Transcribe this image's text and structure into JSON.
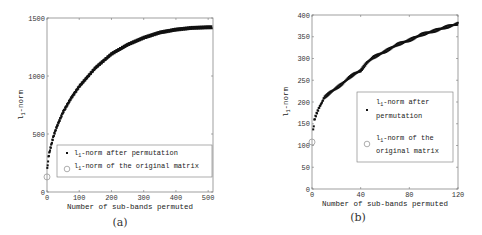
{
  "chart_data": [
    {
      "type": "scatter",
      "panel": "(a)",
      "xlabel": "Number of sub-bands permuted",
      "ylabel": "l1-norm",
      "xlim": [
        0,
        515
      ],
      "ylim": [
        0,
        1500
      ],
      "xticks": [
        0,
        100,
        200,
        300,
        400,
        500
      ],
      "yticks": [
        0,
        500,
        1000,
        1500
      ],
      "grid": false,
      "legend_position": "lower right (inside)",
      "series": [
        {
          "name": "l1-norm after permutation",
          "marker": "dot",
          "x": [
            1,
            5,
            10,
            20,
            30,
            50,
            75,
            100,
            150,
            200,
            250,
            300,
            350,
            400,
            450,
            500,
            512
          ],
          "y": [
            200,
            310,
            370,
            480,
            560,
            690,
            810,
            910,
            1070,
            1190,
            1270,
            1330,
            1375,
            1400,
            1415,
            1420,
            1420
          ]
        },
        {
          "name": "l1-norm of the original matrix",
          "marker": "circle",
          "x": [
            0
          ],
          "y": [
            130
          ]
        }
      ]
    },
    {
      "type": "scatter",
      "panel": "(b)",
      "xlabel": "Number of sub-bands permuted",
      "ylabel": "l1-norm",
      "xlim": [
        0,
        120
      ],
      "ylim": [
        0,
        400
      ],
      "xticks": [
        0,
        40,
        80,
        120
      ],
      "yticks": [
        0,
        50,
        100,
        150,
        200,
        250,
        300,
        350,
        400
      ],
      "grid": false,
      "legend_position": "right (inside)",
      "series": [
        {
          "name": "l1-norm after permutation",
          "marker": "dot",
          "x": [
            1,
            2,
            4,
            6,
            8,
            10,
            15,
            20,
            25,
            30,
            35,
            40,
            45,
            50,
            60,
            70,
            80,
            90,
            100,
            110,
            120
          ],
          "y": [
            135,
            160,
            175,
            188,
            198,
            210,
            222,
            232,
            242,
            255,
            265,
            272,
            290,
            302,
            316,
            332,
            342,
            355,
            363,
            372,
            380
          ]
        },
        {
          "name": "l1-norm of the original matrix",
          "marker": "circle",
          "x": [
            0
          ],
          "y": [
            108
          ]
        }
      ]
    }
  ],
  "panels": {
    "a": {
      "caption": "(a)",
      "legend": [
        "-norm after permutation",
        "-norm of the original matrix"
      ]
    },
    "b": {
      "caption": "(b)",
      "legend_line1": [
        "-norm after",
        "permutation"
      ],
      "legend_line2": [
        "-norm of the",
        "original matrix"
      ]
    }
  },
  "labels": {
    "ylabel_base": "l",
    "ylabel_sub": "1",
    "ylabel_rest": "-norm",
    "xlabel": "Number of sub-bands permuted",
    "legend_base": "l",
    "legend_sub": "1"
  }
}
